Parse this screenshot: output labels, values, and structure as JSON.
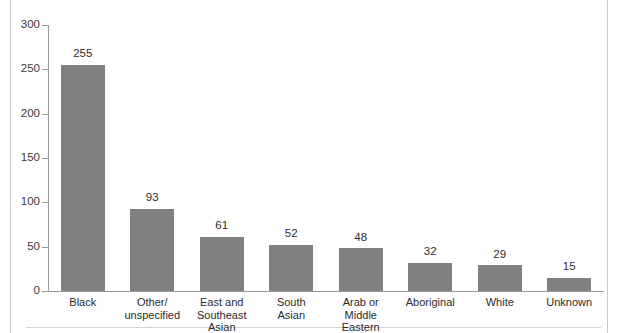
{
  "chart_data": {
    "type": "bar",
    "title": "",
    "subtitle": "",
    "xlabel": "",
    "ylabel": "",
    "ylim": [
      0,
      300
    ],
    "ytick_values": [
      0,
      50,
      100,
      150,
      200,
      250,
      300
    ],
    "ytick_labels": [
      "0",
      "50",
      "100",
      "150",
      "200",
      "250",
      "300"
    ],
    "grid": false,
    "legend": null,
    "bar_color": "#808080",
    "categories": [
      "Black",
      "Other/\nunspecified",
      "East and\nSoutheast Asian",
      "South\nAsian",
      "Arab or\nMiddle Eastern",
      "Aboriginal",
      "White",
      "Unknown"
    ],
    "values": [
      255,
      93,
      61,
      52,
      48,
      32,
      29,
      15
    ],
    "data_labels": [
      "255",
      "93",
      "61",
      "52",
      "48",
      "32",
      "29",
      "15"
    ]
  }
}
